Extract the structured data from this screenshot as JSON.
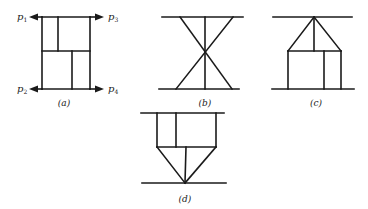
{
  "figure": {
    "panels": [
      {
        "id": "a",
        "caption": "(a)",
        "ports": [
          {
            "name": "p",
            "sub": "1"
          },
          {
            "name": "p",
            "sub": "2"
          },
          {
            "name": "p",
            "sub": "3"
          },
          {
            "name": "p",
            "sub": "4"
          }
        ]
      },
      {
        "id": "b",
        "caption": "(b)"
      },
      {
        "id": "c",
        "caption": "(c)"
      },
      {
        "id": "d",
        "caption": "(d)"
      }
    ]
  }
}
